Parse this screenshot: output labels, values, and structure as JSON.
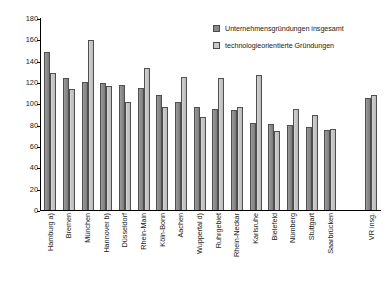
{
  "chart_data": {
    "type": "bar",
    "title": "",
    "xlabel": "",
    "ylabel": "",
    "ylim": [
      0,
      180
    ],
    "ytick_step": 20,
    "yticks": [
      0,
      20,
      40,
      60,
      80,
      100,
      120,
      140,
      160,
      180
    ],
    "grid": false,
    "legend_position": "top-right",
    "categories": [
      "Hamburg a)",
      "Bremen",
      "München",
      "Hannover b)",
      "Düsseldorf",
      "Rhein-Main",
      "Köln-Bonn",
      "Aachen",
      "Wuppertal d)",
      "Ruhrgebiet",
      "Rhein-Neckar",
      "Karlsruhe",
      "Bielefeld",
      "Nürnberg",
      "Stuttgart",
      "Saarbrücken",
      "VR insg."
    ],
    "series": [
      {
        "name": "Unternehmensgründungen insgesamt",
        "color": "#8c8c8c",
        "values": [
          148,
          124,
          120,
          119,
          117,
          114,
          108,
          101,
          97,
          95,
          94,
          82,
          81,
          80,
          78,
          75,
          105
        ]
      },
      {
        "name": "technologieorientierte Gründungen",
        "color": "#c6c6c6",
        "values": [
          128,
          113,
          159,
          116,
          101,
          133,
          97,
          125,
          87,
          124,
          97,
          127,
          74,
          95,
          89,
          76,
          108
        ]
      }
    ],
    "separator_before_index": 16
  },
  "legend": {
    "items": [
      {
        "label": "Unternehmensgründungen insgesamt",
        "swatch": "legend-swatch-series-1"
      },
      {
        "label": "technologieorientierte Gründungen",
        "swatch": "legend-swatch-series-2"
      }
    ]
  }
}
